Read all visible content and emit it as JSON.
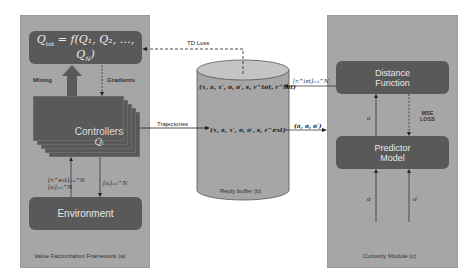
{
  "value_factorization": {
    "caption": "Value Factorization Framework (a)",
    "mixer_formula": "Q_tot = f(Q₁, Q₂, …, Q_N)",
    "mixer_formula_display": {
      "lhs": "Q",
      "lhs_sub": "tot",
      "rhs": " = f(Q₁, Q₂, …, Q",
      "rhs_sub": "N",
      "close": ")"
    },
    "mixing_label": "Mixing",
    "gradients_label": "Gradients",
    "controllers_label": "Controllers",
    "controllers_sub": "Qᵢ",
    "environment_label": "Environment",
    "obs_label_line1": "[rᵢ^ext]ᵢ₌₁^N",
    "obs_label_line2": "[oᵢ]ᵢ₌₁^N",
    "action_label": "[aᵢ]ᵢ₌₁^N"
  },
  "replay_buffer": {
    "caption": "Reply buffer (b)",
    "top_tuple": "(τ, a, τ′, o, o′, s, r^tot, r^int)",
    "mid_tuple": "(τ, a, τ′, o, o′, s, r^ext)"
  },
  "curiosity": {
    "caption": "Curiosity Module (c)",
    "distance_line1": "Distance",
    "distance_line2": "Function",
    "predictor_line1": "Predictor",
    "predictor_line2": "Model",
    "mse_line1": "MSE",
    "mse_line2": "LOSS",
    "a_label": "a",
    "o_label": "o",
    "o_prime_label": "o′"
  },
  "edges": {
    "td_loss": "TD Loss",
    "trajectories": "Trajectories",
    "intrinsic_reward": "[rᵢ^int]ᵢ₌₁^N",
    "sample": "(a, o, o′)"
  },
  "colors": {
    "panel": "#a6a6a6",
    "dark_box": "#595959",
    "cylinder": "#a6a6a6",
    "line": "#222222"
  }
}
